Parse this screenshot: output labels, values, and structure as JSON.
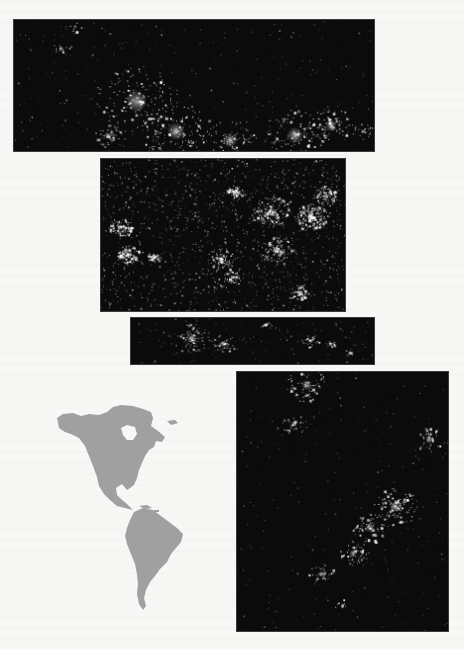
{
  "page": {
    "background": "#f7f7f5",
    "panel_background": "#0b0b0b",
    "light_color": "#ffffff",
    "map_fill": "#a0a0a0"
  },
  "panels": [
    {
      "id": "north-america-north",
      "label": "Northern North America at night",
      "x": 13,
      "y": 19,
      "w": 362,
      "h": 133,
      "seed": 11,
      "background_points": 260,
      "background_alpha": 0.35,
      "clusters": [
        {
          "x": 0.13,
          "y": 0.22,
          "r": 0.03,
          "n": 12
        },
        {
          "x": 0.17,
          "y": 0.05,
          "r": 0.02,
          "n": 6
        },
        {
          "x": 0.34,
          "y": 0.62,
          "r": 0.12,
          "n": 160
        },
        {
          "x": 0.26,
          "y": 0.88,
          "r": 0.04,
          "n": 50
        },
        {
          "x": 0.45,
          "y": 0.85,
          "r": 0.1,
          "n": 140
        },
        {
          "x": 0.6,
          "y": 0.92,
          "r": 0.08,
          "n": 90
        },
        {
          "x": 0.78,
          "y": 0.88,
          "r": 0.09,
          "n": 120
        },
        {
          "x": 0.88,
          "y": 0.8,
          "r": 0.06,
          "n": 80
        },
        {
          "x": 0.97,
          "y": 0.85,
          "r": 0.03,
          "n": 25
        }
      ]
    },
    {
      "id": "contiguous-united-states",
      "label": "Contiguous United States at night",
      "x": 100,
      "y": 158,
      "w": 246,
      "h": 154,
      "seed": 23,
      "background_points": 1200,
      "background_alpha": 0.55,
      "clusters": [
        {
          "x": 0.08,
          "y": 0.45,
          "r": 0.05,
          "n": 90
        },
        {
          "x": 0.11,
          "y": 0.63,
          "r": 0.05,
          "n": 110
        },
        {
          "x": 0.22,
          "y": 0.64,
          "r": 0.03,
          "n": 40
        },
        {
          "x": 0.55,
          "y": 0.22,
          "r": 0.04,
          "n": 70
        },
        {
          "x": 0.86,
          "y": 0.38,
          "r": 0.07,
          "n": 180
        },
        {
          "x": 0.92,
          "y": 0.24,
          "r": 0.05,
          "n": 90
        },
        {
          "x": 0.49,
          "y": 0.66,
          "r": 0.06,
          "n": 90
        },
        {
          "x": 0.72,
          "y": 0.6,
          "r": 0.07,
          "n": 100
        },
        {
          "x": 0.81,
          "y": 0.88,
          "r": 0.04,
          "n": 70
        },
        {
          "x": 0.7,
          "y": 0.35,
          "r": 0.08,
          "n": 150
        },
        {
          "x": 0.54,
          "y": 0.78,
          "r": 0.04,
          "n": 50
        }
      ]
    },
    {
      "id": "mexico-caribbean",
      "label": "Mexico and Caribbean at night",
      "x": 130,
      "y": 317,
      "w": 245,
      "h": 48,
      "seed": 37,
      "background_points": 120,
      "background_alpha": 0.3,
      "clusters": [
        {
          "x": 0.25,
          "y": 0.45,
          "r": 0.08,
          "n": 80
        },
        {
          "x": 0.38,
          "y": 0.55,
          "r": 0.05,
          "n": 40
        },
        {
          "x": 0.55,
          "y": 0.15,
          "r": 0.03,
          "n": 15
        },
        {
          "x": 0.74,
          "y": 0.5,
          "r": 0.04,
          "n": 25
        },
        {
          "x": 0.82,
          "y": 0.55,
          "r": 0.02,
          "n": 18
        },
        {
          "x": 0.9,
          "y": 0.75,
          "r": 0.02,
          "n": 10
        }
      ]
    },
    {
      "id": "south-america",
      "label": "South America at night",
      "x": 236,
      "y": 371,
      "w": 213,
      "h": 261,
      "seed": 53,
      "background_points": 220,
      "background_alpha": 0.3,
      "clusters": [
        {
          "x": 0.33,
          "y": 0.05,
          "r": 0.08,
          "n": 70
        },
        {
          "x": 0.27,
          "y": 0.2,
          "r": 0.05,
          "n": 35
        },
        {
          "x": 0.91,
          "y": 0.26,
          "r": 0.06,
          "n": 50
        },
        {
          "x": 0.75,
          "y": 0.52,
          "r": 0.09,
          "n": 120
        },
        {
          "x": 0.63,
          "y": 0.6,
          "r": 0.07,
          "n": 70
        },
        {
          "x": 0.55,
          "y": 0.7,
          "r": 0.06,
          "n": 55
        },
        {
          "x": 0.4,
          "y": 0.78,
          "r": 0.05,
          "n": 30
        },
        {
          "x": 0.5,
          "y": 0.9,
          "r": 0.03,
          "n": 12
        }
      ]
    }
  ],
  "locator_map": {
    "label": "Locator map of the Americas",
    "fill": "#a0a0a0"
  }
}
